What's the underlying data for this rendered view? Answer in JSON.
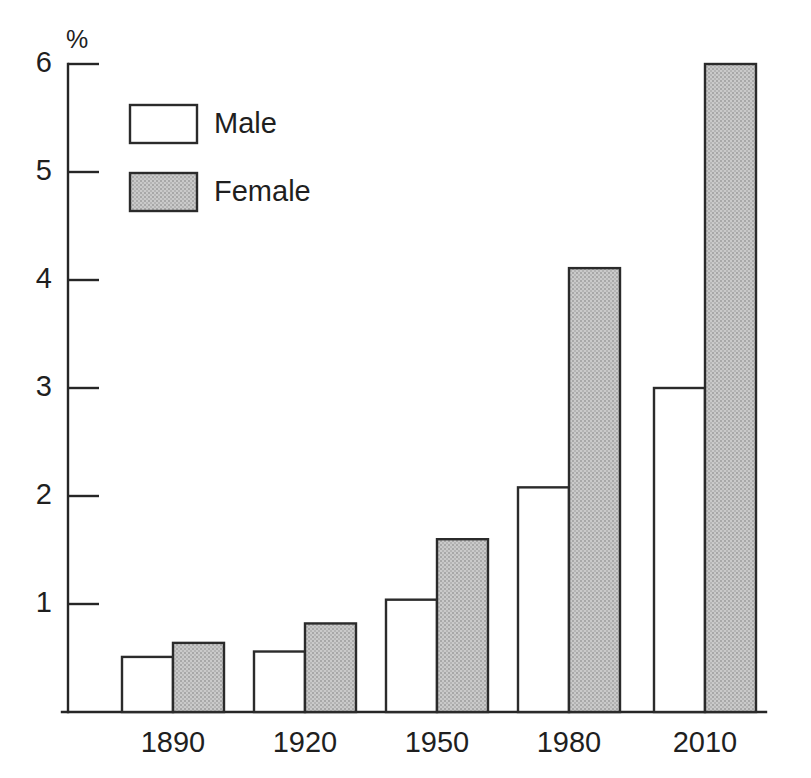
{
  "chart_data": {
    "type": "bar",
    "title": "",
    "subtitle": "",
    "xlabel": "",
    "ylabel": "",
    "unit_label": "%",
    "categories": [
      "1890",
      "1920",
      "1950",
      "1980",
      "2010"
    ],
    "series": [
      {
        "name": "Male",
        "fill": "#ffffff",
        "values": [
          0.51,
          0.56,
          1.04,
          2.08,
          3.0
        ]
      },
      {
        "name": "Female",
        "fill": "#c2c2c2",
        "values": [
          0.64,
          0.82,
          1.6,
          4.11,
          6.0
        ]
      }
    ],
    "ylim": [
      0,
      6.2
    ],
    "yticks": [
      1,
      2,
      3,
      4,
      5,
      6
    ],
    "ytick_labels": [
      "1",
      "2",
      "3",
      "4",
      "5",
      "6"
    ],
    "grid": false,
    "legend_position": "upper-left",
    "axis_color": "#262626"
  },
  "legend": {
    "entries": [
      {
        "label": "Male"
      },
      {
        "label": "Female"
      }
    ]
  },
  "axis": {
    "unit": "%",
    "y_labels": [
      "6",
      "5",
      "4",
      "3",
      "2",
      "1"
    ],
    "x_labels": [
      "1890",
      "1920",
      "1950",
      "1980",
      "2010"
    ]
  }
}
